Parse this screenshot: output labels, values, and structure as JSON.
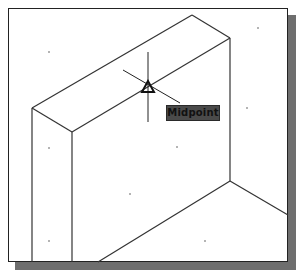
{
  "viewport": {
    "background": "#ffffff",
    "border_color": "#222222",
    "shadow_color": "#6e6e6e"
  },
  "drawing": {
    "line_color": "#333333",
    "model": "isometric-wall-block",
    "edges": [
      {
        "from": [
          32,
          108
        ],
        "to": [
          192,
          15
        ]
      },
      {
        "from": [
          192,
          15
        ],
        "to": [
          230,
          38
        ]
      },
      {
        "from": [
          32,
          108
        ],
        "to": [
          72,
          132
        ]
      },
      {
        "from": [
          72,
          132
        ],
        "to": [
          230,
          38
        ]
      },
      {
        "from": [
          32,
          108
        ],
        "to": [
          32,
          262
        ]
      },
      {
        "from": [
          72,
          132
        ],
        "to": [
          72,
          262
        ]
      },
      {
        "from": [
          230,
          38
        ],
        "to": [
          230,
          181
        ]
      },
      {
        "from": [
          230,
          181
        ],
        "to": [
          98,
          262
        ]
      },
      {
        "from": [
          230,
          181
        ],
        "to": [
          288,
          215
        ]
      }
    ],
    "grid_dots": [
      [
        49,
        52
      ],
      [
        247,
        108
      ],
      [
        49,
        148
      ],
      [
        177,
        147
      ],
      [
        130,
        194
      ],
      [
        49,
        241
      ],
      [
        205,
        241
      ],
      [
        258,
        28
      ]
    ]
  },
  "osnap": {
    "cursor_center": [
      148,
      87
    ],
    "marker": "midpoint-triangle",
    "tooltip_label": "Midpoint",
    "tooltip_bg": "#4a4a4a"
  }
}
